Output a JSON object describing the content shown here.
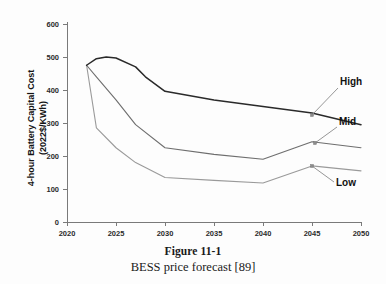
{
  "figure": {
    "caption_title": "Figure 11-1",
    "caption_subtitle": "BESS price forecast [89]"
  },
  "chart_data": {
    "type": "line",
    "title": "",
    "xlabel": "",
    "ylabel": "4-hour Battery Capital Cost (2022$/KWh)",
    "xlim": [
      2020,
      2050
    ],
    "ylim": [
      0,
      600
    ],
    "xticks": [
      2020,
      2025,
      2030,
      2035,
      2040,
      2045,
      2050
    ],
    "yticks": [
      0,
      100,
      200,
      300,
      400,
      500,
      600
    ],
    "xtick_labels": [
      "2020",
      "2025",
      "2030",
      "2035",
      "2040",
      "2045",
      "2050"
    ],
    "ytick_labels": [
      "0",
      "100",
      "200",
      "300",
      "400",
      "500",
      "600"
    ],
    "grid": false,
    "legend": "inline-annotations",
    "annotations": [
      {
        "text": "High",
        "series": "High",
        "anchor_x": 2045,
        "anchor_y": 330
      },
      {
        "text": "Mid",
        "series": "Mid",
        "anchor_x": 2046,
        "anchor_y": 243
      },
      {
        "text": "Low",
        "series": "Low",
        "anchor_x": 2045,
        "anchor_y": 170
      }
    ],
    "series": [
      {
        "name": "High",
        "color": "#2a2a2a",
        "x": [
          2022,
          2023,
          2024,
          2025,
          2027,
          2028,
          2030,
          2035,
          2040,
          2045,
          2050
        ],
        "values": [
          475,
          495,
          500,
          497,
          470,
          440,
          396,
          370,
          350,
          330,
          295
        ]
      },
      {
        "name": "Mid",
        "color": "#6e6e6e",
        "x": [
          2022,
          2023,
          2025,
          2027,
          2030,
          2035,
          2040,
          2045,
          2050
        ],
        "values": [
          475,
          440,
          370,
          295,
          225,
          205,
          190,
          243,
          225
        ]
      },
      {
        "name": "Low",
        "color": "#9a9a9a",
        "x": [
          2022,
          2023,
          2025,
          2027,
          2030,
          2035,
          2040,
          2045,
          2050
        ],
        "values": [
          475,
          285,
          225,
          180,
          135,
          126,
          118,
          170,
          155
        ]
      }
    ]
  }
}
